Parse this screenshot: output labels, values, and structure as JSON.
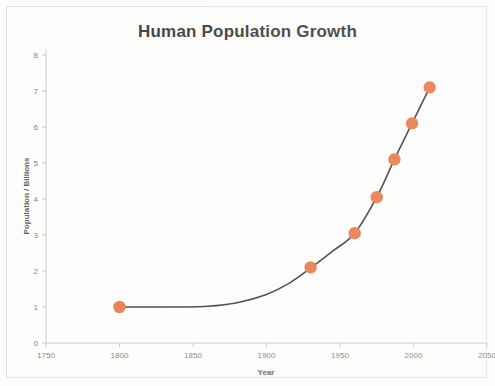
{
  "chart_data": {
    "type": "scatter",
    "title": "Human Population Growth",
    "xlabel": "Year",
    "ylabel": "Population / Billions",
    "xlim": [
      1750,
      2050
    ],
    "ylim": [
      0,
      8
    ],
    "xticks": [
      "1750",
      "1800",
      "1850",
      "1900",
      "1950",
      "2000",
      "2050"
    ],
    "yticks": [
      "0",
      "1",
      "2",
      "3",
      "4",
      "5",
      "6",
      "7",
      "8"
    ],
    "xtick_values": [
      1750,
      1800,
      1850,
      1900,
      1950,
      2000,
      2050
    ],
    "ytick_values": [
      0,
      1,
      2,
      3,
      4,
      5,
      6,
      7,
      8
    ],
    "grid": false,
    "legend": "none",
    "marker_color": "#e8784a",
    "line_color": "#3d3d3d",
    "x": [
      1800,
      1930,
      1960,
      1975,
      1987,
      1999,
      2011
    ],
    "values": [
      1.0,
      2.1,
      3.05,
      4.05,
      5.1,
      6.1,
      7.1
    ],
    "series": [
      {
        "name": "World population",
        "points": [
          {
            "year": 1800,
            "population": 1.0
          },
          {
            "year": 1930,
            "population": 2.1
          },
          {
            "year": 1960,
            "population": 3.05
          },
          {
            "year": 1975,
            "population": 4.05
          },
          {
            "year": 1987,
            "population": 5.1
          },
          {
            "year": 1999,
            "population": 6.1
          },
          {
            "year": 2011,
            "population": 7.1
          }
        ]
      }
    ],
    "trend_curve": [
      {
        "year": 1800,
        "population": 1.0
      },
      {
        "year": 1820,
        "population": 1.0
      },
      {
        "year": 1840,
        "population": 1.0
      },
      {
        "year": 1860,
        "population": 1.02
      },
      {
        "year": 1880,
        "population": 1.12
      },
      {
        "year": 1900,
        "population": 1.35
      },
      {
        "year": 1915,
        "population": 1.65
      },
      {
        "year": 1930,
        "population": 2.08
      },
      {
        "year": 1945,
        "population": 2.55
      },
      {
        "year": 1960,
        "population": 3.05
      },
      {
        "year": 1975,
        "population": 4.05
      },
      {
        "year": 1987,
        "population": 5.1
      },
      {
        "year": 1999,
        "population": 6.1
      },
      {
        "year": 2011,
        "population": 7.1
      }
    ]
  }
}
